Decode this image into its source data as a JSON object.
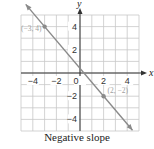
{
  "caption": "Negative slope",
  "colors": {
    "line": "#8a8a8a",
    "grid": "#c8c8c8",
    "axis": "#333333",
    "point_label": "#a0a0a0"
  },
  "chart_data": {
    "type": "line",
    "title": "Negative slope",
    "xlabel": "x",
    "ylabel": "y",
    "xlim": [
      -5,
      5
    ],
    "ylim": [
      -5,
      5
    ],
    "grid": true,
    "x_ticks": [
      -4,
      -2,
      0,
      2,
      4
    ],
    "y_ticks": [
      4,
      2,
      -2,
      -4
    ],
    "series": [
      {
        "name": "line",
        "x": [
          -3,
          2
        ],
        "y": [
          4,
          -2
        ]
      }
    ],
    "points": [
      {
        "label": "(−3, 4)",
        "x": -3,
        "y": 4
      },
      {
        "label": "(2, −2)",
        "x": 2,
        "y": -2
      }
    ]
  }
}
